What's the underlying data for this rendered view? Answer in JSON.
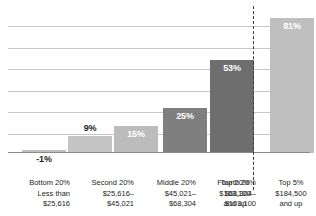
{
  "chart_data": {
    "type": "bar",
    "title": "",
    "subtitle": "",
    "xlabel": "",
    "ylabel": "",
    "grid": true,
    "legend": null,
    "ylim": [
      -10,
      90
    ],
    "gridline_step": 14,
    "categories": [
      "Bottom 20%\nLess than\n$25,616",
      "Second 20%\n$25,616–\n$45,021",
      "Middle 20%\n$45,021–\n$68,304",
      "Fourth 20%\n$68,304–\n$103,100",
      "Top 20%\n$103,100\nand up",
      "Top 5%\n$184,500\nand up"
    ],
    "values": [
      -1,
      9,
      15,
      25,
      53,
      81
    ],
    "data_labels": [
      "-1%",
      "9%",
      "15%",
      "25%",
      "53%",
      "81%"
    ],
    "annotations": [
      "dashed vertical divider separating Top 5% from the quintile groups"
    ]
  },
  "bars": [
    {
      "id": "bar-bottom-20",
      "value": -1,
      "label": "-1%",
      "label_position": "below",
      "color": "#bfbfbf",
      "x": 14,
      "width": 44,
      "height": 3
    },
    {
      "id": "bar-second-20",
      "value": 9,
      "label": "9%",
      "label_position": "above",
      "color": "#c4c4c4",
      "x": 60,
      "width": 44,
      "height": 17
    },
    {
      "id": "bar-middle-20",
      "value": 15,
      "label": "15%",
      "label_position": "inside",
      "color": "#bcbcbc",
      "x": 106,
      "width": 44,
      "height": 27
    },
    {
      "id": "bar-fourth-20",
      "value": 25,
      "label": "25%",
      "label_position": "inside",
      "color": "#7f7f7f",
      "x": 155,
      "width": 44,
      "height": 45
    },
    {
      "id": "bar-top-20",
      "value": 53,
      "label": "53%",
      "label_position": "inside",
      "color": "#6e6e6e",
      "x": 202,
      "width": 44,
      "height": 93
    },
    {
      "id": "bar-top-5",
      "value": 81,
      "label": "81%",
      "label_position": "inside",
      "color": "#bfbfbf",
      "x": 262,
      "width": 44,
      "height": 135
    }
  ],
  "gridlines": [
    {
      "y": 18
    },
    {
      "y": 40
    },
    {
      "y": 61
    },
    {
      "y": 83
    },
    {
      "y": 104
    },
    {
      "y": 126
    }
  ],
  "axis_labels": [
    {
      "id": "axis-label-bottom-20",
      "align": "right",
      "x": 0,
      "width": 62,
      "lines": [
        "Bottom 20%",
        "Less than",
        "$25,616"
      ]
    },
    {
      "id": "axis-label-second-20",
      "align": "right",
      "x": 64,
      "width": 62,
      "lines": [
        "Second 20%",
        "$25,616–",
        "$45,021"
      ]
    },
    {
      "id": "axis-label-middle-20",
      "align": "right",
      "x": 126,
      "width": 62,
      "lines": [
        "Middle 20%",
        "$45,021–",
        "$68,304"
      ]
    },
    {
      "id": "axis-label-fourth-20",
      "align": "right",
      "x": 186,
      "width": 62,
      "lines": [
        "Fourth 20%",
        "$68,304–",
        "$103,100"
      ]
    },
    {
      "id": "axis-label-top-20",
      "align": "center",
      "x": 196,
      "width": 62,
      "lines": [
        "Top 20%",
        "$103,100",
        "and up"
      ]
    },
    {
      "id": "axis-label-top-5",
      "align": "center",
      "x": 252,
      "width": 62,
      "lines": [
        "Top 5%",
        "$184,500",
        "and up"
      ]
    }
  ]
}
